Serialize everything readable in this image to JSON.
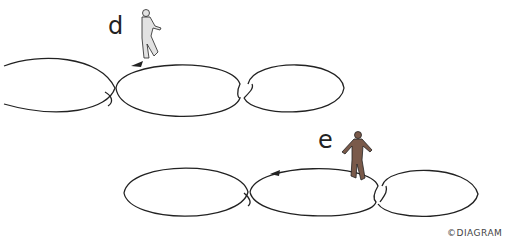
{
  "figures": [
    {
      "label": "d",
      "figure_color": "#dcdcdc",
      "description": "skater on top of middle lobe, row 1"
    },
    {
      "label": "e",
      "figure_color": "#7a5a4a",
      "description": "skater at right junction, row 2"
    }
  ],
  "credit": "©DIAGRAM",
  "colors": {
    "line": "#222222",
    "skater_e": "#7a5a4a",
    "skater_d": "#e0e0e0"
  }
}
